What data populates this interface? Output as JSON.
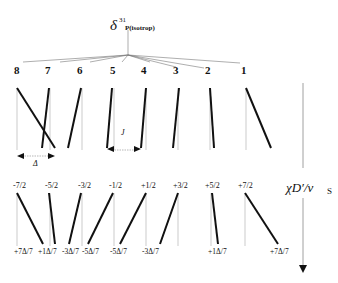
{
  "title": {
    "symbol": "δ",
    "superscript": "31",
    "subscript": "P(isotrop)"
  },
  "peaks": {
    "numbers": [
      "8",
      "7",
      "6",
      "5",
      "4",
      "3",
      "2",
      "1"
    ]
  },
  "annotations": {
    "delta": "Δ",
    "j": "J"
  },
  "transitions": {
    "labels": [
      "-7/2",
      "-5/2",
      "-3/2",
      "-1/2",
      "+1/2",
      "+3/2",
      "+5/2",
      "+7/2"
    ]
  },
  "shifts": {
    "labels": [
      "+7Δ/7",
      "+1Δ/7",
      "-3Δ/7",
      "-5Δ/7",
      "-5Δ/7",
      "-3Δ/7",
      "+1Δ/7",
      "+7Δ/7"
    ]
  },
  "axis": {
    "label_main": "χD′/ν",
    "label_sub": "S"
  },
  "colors": {
    "line": "#111111",
    "guide": "#aaaaaa"
  }
}
